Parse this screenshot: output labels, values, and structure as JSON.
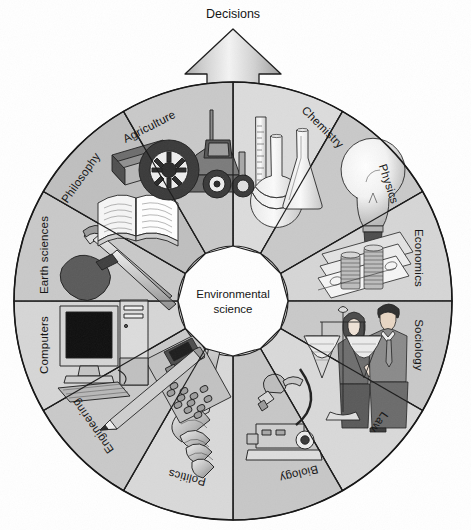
{
  "diagram": {
    "title_top": "Decisions",
    "center_line1": "Environmental",
    "center_line2": "science",
    "center_text": "Environmental science",
    "arrow_direction": "up",
    "segment_count": 12,
    "segments": [
      {
        "label": "Chemistry",
        "icon": "flasks-icon",
        "shade": "#dcdcdc",
        "angle_start": -90,
        "angle_end": -60
      },
      {
        "label": "Physics",
        "icon": "lightbulb-icon",
        "shade": "#c9c9c9",
        "angle_start": -60,
        "angle_end": -30
      },
      {
        "label": "Economics",
        "icon": "money-coins-icon",
        "shade": "#d6d6d6",
        "angle_start": -30,
        "angle_end": 0
      },
      {
        "label": "Sociology",
        "icon": "two-people-icon",
        "shade": "#c9c9c9",
        "angle_start": 0,
        "angle_end": 30
      },
      {
        "label": "Law",
        "icon": "scales-icon",
        "shade": "#d9d9d9",
        "angle_start": 30,
        "angle_end": 60
      },
      {
        "label": "Biology",
        "icon": "microscope-icon",
        "shade": "#c7c7c7",
        "angle_start": 60,
        "angle_end": 90
      },
      {
        "label": "Politics",
        "icon": "gavel-icon",
        "shade": "#d9d9d9",
        "angle_start": 90,
        "angle_end": 120
      },
      {
        "label": "Engineering",
        "icon": "calculator-icon",
        "shade": "#c9c9c9",
        "angle_start": 120,
        "angle_end": 150
      },
      {
        "label": "Computers",
        "icon": "desktop-pc-icon",
        "shade": "#d6d6d6",
        "angle_start": 150,
        "angle_end": 180
      },
      {
        "label": "Earth sciences",
        "icon": "shovel-pick-icon",
        "shade": "#c9c9c9",
        "angle_start": 180,
        "angle_end": 210
      },
      {
        "label": "Philosophy",
        "icon": "books-icon",
        "shade": "#bfbfbf",
        "angle_start": 210,
        "angle_end": 240
      },
      {
        "label": "Agriculture",
        "icon": "tractor-icon",
        "shade": "#c9c9c9",
        "angle_start": 240,
        "angle_end": 270
      }
    ],
    "colors": {
      "background": "#ffffff",
      "outline": "#1a1a1a",
      "center_fill": "#ffffff",
      "arrow_fill_light": "#f2f2f2",
      "arrow_fill_dark": "#9a9a9a",
      "text": "#111111"
    },
    "geometry": {
      "center_x": 233,
      "center_y": 301,
      "outer_radius": 219,
      "inner_radius": 55,
      "label_radius": 186,
      "arrow_tip_y": 29
    }
  }
}
